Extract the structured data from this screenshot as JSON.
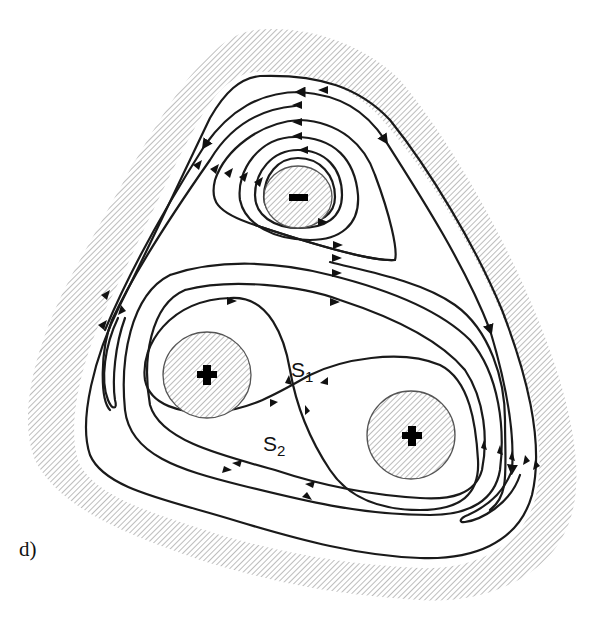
{
  "figure": {
    "panel_label": "d)",
    "vortices": [
      {
        "sign": "-",
        "symbol": "minus",
        "center": [
          298,
          197
        ],
        "radius": [
          34,
          31
        ]
      },
      {
        "sign": "+",
        "symbol": "plus",
        "center": [
          207,
          375
        ],
        "radius": [
          44,
          43
        ]
      },
      {
        "sign": "+",
        "symbol": "plus",
        "center": [
          411,
          435
        ],
        "radius": [
          44,
          44
        ]
      }
    ],
    "stagnation_points": [
      {
        "label": "S",
        "subscript": "1"
      },
      {
        "label": "S",
        "subscript": "2"
      }
    ],
    "boundary": {
      "style": "hatched",
      "color": "#9a9a9a"
    },
    "line_color": "#1a1a1a"
  }
}
